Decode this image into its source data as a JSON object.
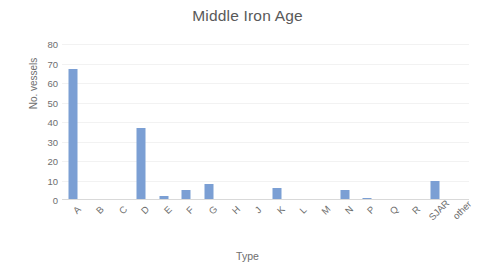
{
  "chart_data": {
    "type": "bar",
    "title": "Middle Iron Age",
    "xlabel": "Type",
    "ylabel": "No. vessels",
    "categories": [
      "A",
      "B",
      "C",
      "D",
      "E",
      "F",
      "G",
      "H",
      "J",
      "K",
      "L",
      "M",
      "N",
      "P",
      "Q",
      "R",
      "SJAR",
      "other"
    ],
    "values": [
      67,
      0,
      0,
      37,
      2,
      5,
      8,
      0,
      0,
      6,
      0,
      0,
      5,
      1,
      0,
      0,
      10,
      0
    ],
    "ylim": [
      0,
      80
    ],
    "ytick_labels": [
      "80",
      "70",
      "60",
      "50",
      "40",
      "30",
      "20",
      "10",
      "0"
    ],
    "ytick_values": [
      80,
      70,
      60,
      50,
      40,
      30,
      20,
      10,
      0
    ],
    "grid": true,
    "legend": false,
    "bar_color": "#7b9fd4",
    "text_color": "#6e6e6e",
    "title_color": "#595959",
    "gridline_color": "#f2f2f2",
    "background": "#ffffff"
  }
}
